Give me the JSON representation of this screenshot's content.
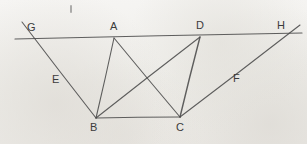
{
  "figure": {
    "background_color": "#f2f1ef",
    "ink_color": "#4a4a4a",
    "label_color": "#3b3b3b",
    "canvas": {
      "width": 307,
      "height": 144
    }
  },
  "points": [
    {
      "id": "G",
      "label": "G",
      "x": 31,
      "y": 39,
      "label_x": 27,
      "label_y": 22
    },
    {
      "id": "A",
      "label": "A",
      "x": 114,
      "y": 38,
      "label_x": 110,
      "label_y": 21
    },
    {
      "id": "D",
      "label": "D",
      "x": 200,
      "y": 37,
      "label_x": 196,
      "label_y": 20
    },
    {
      "id": "H",
      "label": "H",
      "x": 288,
      "y": 34,
      "label_x": 277,
      "label_y": 20
    },
    {
      "id": "B",
      "label": "B",
      "x": 96,
      "y": 118,
      "label_x": 90,
      "label_y": 122
    },
    {
      "id": "C",
      "label": "C",
      "x": 180,
      "y": 117,
      "label_x": 176,
      "label_y": 122
    },
    {
      "id": "E",
      "label": "E",
      "x": 58,
      "y": 79,
      "label_x": 52,
      "label_y": 74
    },
    {
      "id": "F",
      "label": "F",
      "x": 238,
      "y": 77,
      "label_x": 233,
      "label_y": 73
    }
  ],
  "segments": [
    {
      "name": "line-GH-transversal",
      "from": [
        15,
        39
      ],
      "to": [
        302,
        33
      ],
      "width": 1.2
    },
    {
      "name": "line-G-to-B",
      "from": [
        22,
        22
      ],
      "to": [
        96,
        118
      ],
      "width": 1.1
    },
    {
      "name": "line-A-to-B",
      "from": [
        114,
        38
      ],
      "to": [
        96,
        118
      ],
      "width": 1.1
    },
    {
      "name": "line-A-to-C",
      "from": [
        114,
        38
      ],
      "to": [
        180,
        117
      ],
      "width": 1.1
    },
    {
      "name": "line-B-to-D",
      "from": [
        96,
        118
      ],
      "to": [
        200,
        37
      ],
      "width": 1.1
    },
    {
      "name": "line-D-to-C",
      "from": [
        200,
        37
      ],
      "to": [
        180,
        117
      ],
      "width": 1.4
    },
    {
      "name": "line-B-to-C-base",
      "from": [
        96,
        118
      ],
      "to": [
        180,
        117
      ],
      "width": 1.2
    },
    {
      "name": "line-C-to-H",
      "from": [
        180,
        117
      ],
      "to": [
        300,
        25
      ],
      "width": 1.1
    }
  ],
  "marks": [
    {
      "name": "stray-pen-tick",
      "x": 70,
      "y": 5,
      "width": 2,
      "height": 8
    }
  ]
}
